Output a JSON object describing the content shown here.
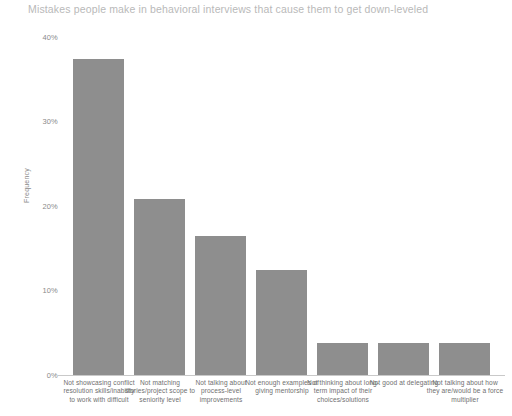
{
  "chart_data": {
    "type": "bar",
    "title": "Mistakes people make in behavioral interviews that cause them to get down-leveled",
    "xlabel": "",
    "ylabel": "Frequency",
    "ylim": [
      0,
      40
    ],
    "ytick_labels": [
      "40%",
      "30%",
      "20%",
      "10%",
      "0%"
    ],
    "ytick_values": [
      40,
      30,
      20,
      10,
      0
    ],
    "grid": false,
    "legend": "none",
    "bar_color": "#8e8e8e",
    "categories": [
      "Not showcasing conflict resolution skills/inability to work with difficult",
      "Not matching stories/project scope to seniority level",
      "Not talking about process-level improvements",
      "Not enough examples of giving mentorship",
      "Not thinking about long-term impact of their choices/solutions",
      "Not good at delegating",
      "Not talking about how they are/would be a force multiplier"
    ],
    "values": [
      37.7,
      21.0,
      16.6,
      12.5,
      3.8,
      3.8,
      3.8
    ]
  }
}
